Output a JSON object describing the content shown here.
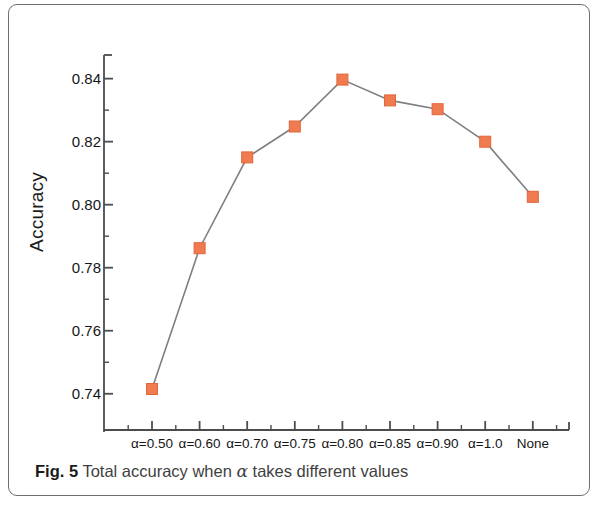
{
  "figure": {
    "caption_label": "Fig. 5",
    "caption_text": "Total accuracy when",
    "caption_alpha": "α",
    "caption_text_end": "takes different values"
  },
  "axes": {
    "y_title": "Accuracy",
    "y_ticks": [
      "0.74",
      "0.76",
      "0.78",
      "0.80",
      "0.82",
      "0.84"
    ],
    "x_ticks": [
      "α=0.50",
      "α=0.60",
      "α=0.70",
      "α=0.75",
      "α=0.80",
      "α=0.85",
      "α=0.90",
      "α=1.0",
      "None"
    ]
  },
  "style": {
    "marker_color": "#f07b50",
    "marker_edge_color": "#e1663a",
    "line_color": "#7c7f83",
    "axis_color": "#4a4c4e",
    "frame_color": "#6d6f72"
  },
  "chart_data": {
    "type": "line",
    "title": "",
    "xlabel": "",
    "ylabel": "Accuracy",
    "categories": [
      "α=0.50",
      "α=0.60",
      "α=0.70",
      "α=0.75",
      "α=0.80",
      "α=0.85",
      "α=0.90",
      "α=1.0",
      "None"
    ],
    "values": [
      0.7415,
      0.7862,
      0.815,
      0.8248,
      0.8397,
      0.8331,
      0.8303,
      0.82,
      0.8025
    ],
    "ylim": [
      0.7285,
      0.8475
    ],
    "yticks": [
      0.74,
      0.76,
      0.78,
      0.8,
      0.82,
      0.84
    ],
    "yticks_minor": [
      0.75,
      0.77,
      0.79,
      0.81,
      0.83
    ],
    "grid": false,
    "legend": false,
    "marker": "square",
    "series": [
      {
        "name": "Total accuracy",
        "values": [
          0.7415,
          0.7862,
          0.815,
          0.8248,
          0.8397,
          0.8331,
          0.8303,
          0.82,
          0.8025
        ]
      }
    ]
  }
}
